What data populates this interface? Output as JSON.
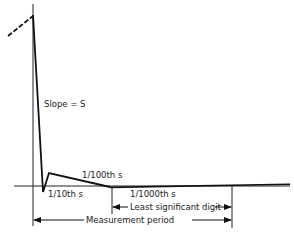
{
  "diagram": {
    "type": "timing-waveform",
    "labels": {
      "slope": "Slope = S",
      "hundredth": "1/100th s",
      "tenth": "1/10th s",
      "thousandth": "1/1000th s",
      "least_significant_digit": "Least significant digit",
      "measurement_period": "Measurement period"
    },
    "colors": {
      "ink": "#111111",
      "background": "#ffffff"
    }
  }
}
